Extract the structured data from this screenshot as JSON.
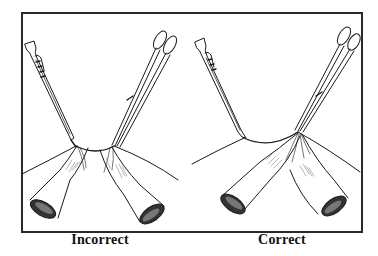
{
  "figure": {
    "panels": [
      {
        "label": "Incorrect",
        "description": "Sponge clamp and Allis clamp applied with tissue bunched between two instruments"
      },
      {
        "label": "Correct",
        "description": "Sponge clamp and Allis clamp applied with tissue pulled taut to single point"
      }
    ],
    "colors": {
      "line": "#1a1a1a",
      "frame": "#2a2a2a",
      "shade": "#9a9a9a",
      "background": "#ffffff"
    }
  }
}
